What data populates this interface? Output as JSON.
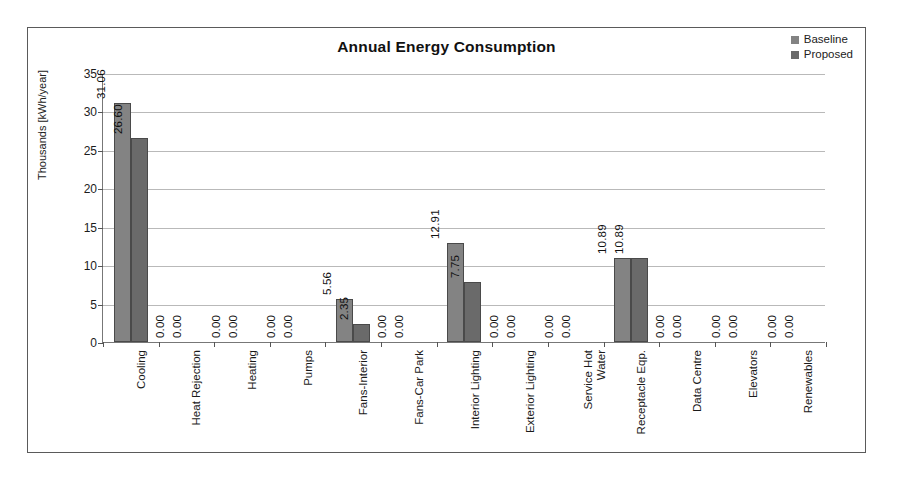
{
  "chart_data": {
    "type": "bar",
    "title": "Annual Energy Consumption",
    "xlabel": "",
    "ylabel": "Thousands [kWh/year]",
    "ylim": [
      0,
      35
    ],
    "ytick_step": 5,
    "yticks": [
      "35",
      "30",
      "25",
      "20",
      "15",
      "10",
      "5",
      "0"
    ],
    "grid": true,
    "legend_position": "top-right",
    "value_labels": true,
    "value_label_format": "0.00",
    "categories": [
      "Cooling",
      "Heat Rejection",
      "Heating",
      "Pumps",
      "Fans-Interior",
      "Fans-Car Park",
      "Interior Lighting",
      "Exterior Lighting",
      "Service Hot Water",
      "Receptacle Eqp.",
      "Data Centre",
      "Elevators",
      "Renewables"
    ],
    "series": [
      {
        "name": "Baseline",
        "color": "#838383",
        "values": [
          31.06,
          0.0,
          0.0,
          0.0,
          5.56,
          0.0,
          12.91,
          0.0,
          0.0,
          10.89,
          0.0,
          0.0,
          0.0
        ],
        "labels": [
          "31.06",
          "0.00",
          "0.00",
          "0.00",
          "5.56",
          "0.00",
          "12.91",
          "0.00",
          "0.00",
          "10.89",
          "0.00",
          "0.00",
          "0.00"
        ]
      },
      {
        "name": "Proposed",
        "color": "#6a6a6a",
        "values": [
          26.6,
          0.0,
          0.0,
          0.0,
          2.35,
          0.0,
          7.75,
          0.0,
          0.0,
          10.89,
          0.0,
          0.0,
          0.0
        ],
        "labels": [
          "26.60",
          "0.00",
          "0.00",
          "0.00",
          "2.35",
          "0.00",
          "7.75",
          "0.00",
          "0.00",
          "10.89",
          "0.00",
          "0.00",
          "0.00"
        ]
      }
    ]
  }
}
